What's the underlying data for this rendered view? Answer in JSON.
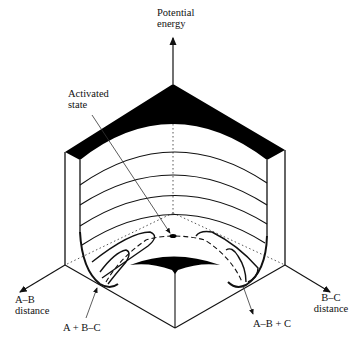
{
  "diagram": {
    "axes": {
      "vertical": {
        "line1": "Potential",
        "line2": "energy"
      },
      "left": {
        "line1": "A–B",
        "line2": "distance"
      },
      "right": {
        "line1": "B–C",
        "line2": "distance"
      }
    },
    "annotations": {
      "activated_state": {
        "line1": "Activated",
        "line2": "state"
      },
      "reactants": "A + B–C",
      "products": "A–B + C"
    },
    "colors": {
      "ink": "#111111",
      "fill": "#000000",
      "background": "#ffffff"
    }
  }
}
